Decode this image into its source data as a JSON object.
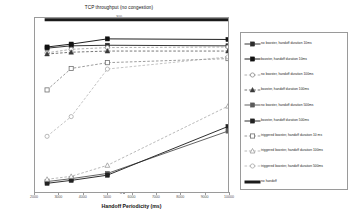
{
  "chart_data": {
    "type": "line",
    "title": "TCP throughput (no congestion)",
    "xlabel": "Handoff Periodicity (ms)",
    "ylabel": "Throughput (KB/s)",
    "xlim": [
      2000,
      10000
    ],
    "ylim": [
      0,
      300
    ],
    "xticks": [
      2000,
      3000,
      4000,
      5000,
      6000,
      7000,
      8000,
      9000,
      10000
    ],
    "yticks": [
      0,
      50,
      100,
      150,
      200,
      250,
      300
    ],
    "grid": false,
    "legend_position": "right",
    "x": [
      2500,
      3500,
      5000,
      10000
    ],
    "series": [
      {
        "name": "no booster, handoff duration 10ms",
        "marker": "filled-square",
        "line": "solid",
        "color": "#2b2b2b",
        "values": [
          248,
          252,
          253,
          252
        ]
      },
      {
        "name": "booster, handoff duration 10ms",
        "marker": "filled-square",
        "line": "solid",
        "color": "#111111",
        "values": [
          250,
          255,
          264,
          263
        ]
      },
      {
        "name": "no booster, handoff duration 100ms",
        "marker": "open-circle",
        "line": "dashed",
        "color": "#8d8d8d",
        "values": [
          240,
          246,
          249,
          250
        ]
      },
      {
        "name": "booster, handoff duration 100ms",
        "marker": "filled-triangle",
        "line": "dashed",
        "color": "#3a3a3a",
        "values": [
          238,
          241,
          243,
          243
        ]
      },
      {
        "name": "no booster, handoff duration 500ms",
        "marker": "filled-square",
        "line": "solid",
        "color": "#5a5a5a",
        "values": [
          18,
          23,
          32,
          105
        ]
      },
      {
        "name": "booster, handoff duration 500ms",
        "marker": "filled-square",
        "line": "solid",
        "color": "#222222",
        "values": [
          15,
          20,
          29,
          113
        ]
      },
      {
        "name": "triggered booster, handoff duration 10 ms",
        "marker": "open-square",
        "line": "dashed",
        "color": "#6f6f6f",
        "values": [
          176,
          213,
          223,
          230
        ]
      },
      {
        "name": "triggered booster, handoff duration 100ms",
        "marker": "open-triangle",
        "line": "dashed",
        "color": "#9b9b9b",
        "values": [
          22,
          27,
          46,
          148
        ]
      },
      {
        "name": "triggered booster, handoff duration 500ms",
        "marker": "open-circle",
        "line": "dashed",
        "color": "#a8a8a8",
        "values": [
          96,
          130,
          212,
          233
        ]
      }
    ],
    "reference_line": {
      "name": "no handoff",
      "value": 297,
      "style": "thick-solid",
      "color": "#1a1a1a"
    }
  }
}
